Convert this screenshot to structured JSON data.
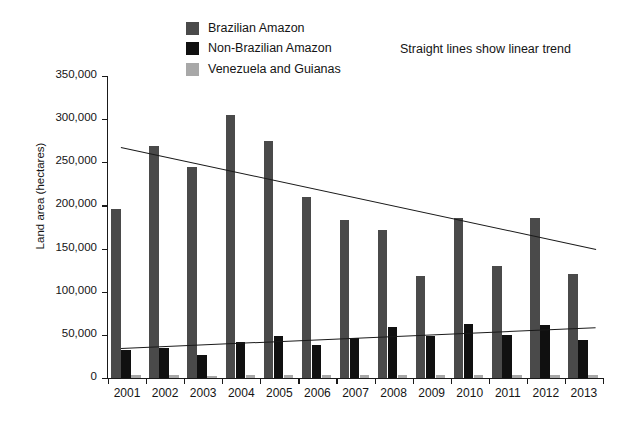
{
  "legend": {
    "items": [
      {
        "label": "Brazilian Amazon",
        "color": "#4a4a4a"
      },
      {
        "label": "Non-Brazilian Amazon",
        "color": "#101010"
      },
      {
        "label": "Venezuela and Guianas",
        "color": "#a8a8a8"
      }
    ],
    "note": "Straight lines show linear trend"
  },
  "chart_data": {
    "type": "bar",
    "title": "",
    "xlabel": "",
    "ylabel": "Land area (hectares)",
    "categories": [
      "2001",
      "2002",
      "2003",
      "2004",
      "2005",
      "2006",
      "2007",
      "2008",
      "2009",
      "2010",
      "2011",
      "2012",
      "2013"
    ],
    "series": [
      {
        "name": "Brazilian Amazon",
        "color": "#4a4a4a",
        "values": [
          196000,
          269000,
          245000,
          305000,
          275000,
          210000,
          183000,
          172000,
          118000,
          185000,
          130000,
          185000,
          121000
        ]
      },
      {
        "name": "Non-Brazilian Amazon",
        "color": "#101010",
        "values": [
          33000,
          35000,
          27000,
          42000,
          49000,
          38000,
          46000,
          59000,
          49000,
          63000,
          50000,
          62000,
          44000
        ]
      },
      {
        "name": "Venezuela and Guianas",
        "color": "#a8a8a8",
        "values": [
          3000,
          3000,
          2500,
          3000,
          3500,
          3000,
          3000,
          3500,
          3000,
          4000,
          3000,
          4000,
          3000
        ]
      }
    ],
    "trendlines": [
      {
        "name": "Brazilian Amazon linear trend",
        "y_start": 268000,
        "y_end": 150000
      },
      {
        "name": "Non-Brazilian Amazon linear trend",
        "y_start": 35000,
        "y_end": 59000
      }
    ],
    "ylim": [
      0,
      350000
    ],
    "yticks": [
      0,
      50000,
      100000,
      150000,
      200000,
      250000,
      300000,
      350000
    ],
    "ytick_labels": [
      "0",
      "50,000",
      "100,000",
      "150,000",
      "200,000",
      "250,000",
      "300,000",
      "350,000"
    ],
    "grid": false,
    "legend_position": "top-left"
  }
}
